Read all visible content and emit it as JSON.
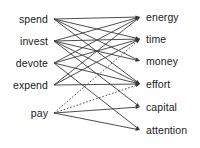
{
  "figure": {
    "type": "bipartite-collocation-network",
    "background_color": "#ffffff",
    "edge_color": "#3a3a3a",
    "text_color": "#1a1a1a",
    "width": 200,
    "height": 148
  },
  "left_column": {
    "name": "verbs",
    "items": [
      {
        "id": "spend",
        "label": "spend",
        "x": 48,
        "y": 19
      },
      {
        "id": "invest",
        "label": "invest",
        "x": 48,
        "y": 41
      },
      {
        "id": "devote",
        "label": "devote",
        "x": 48,
        "y": 63
      },
      {
        "id": "expend",
        "label": "expend",
        "x": 48,
        "y": 85
      },
      {
        "id": "pay",
        "label": "pay",
        "x": 48,
        "y": 113
      }
    ]
  },
  "right_column": {
    "name": "nouns",
    "items": [
      {
        "id": "energy",
        "label": "energy",
        "x": 146,
        "y": 17
      },
      {
        "id": "time",
        "label": "time",
        "x": 146,
        "y": 39
      },
      {
        "id": "money",
        "label": "money",
        "x": 146,
        "y": 61
      },
      {
        "id": "effort",
        "label": "effort",
        "x": 146,
        "y": 84
      },
      {
        "id": "capital",
        "label": "capital",
        "x": 146,
        "y": 107
      },
      {
        "id": "attention",
        "label": "attention",
        "x": 146,
        "y": 130
      }
    ]
  },
  "edges": [
    {
      "from": "spend",
      "to": "energy",
      "style": "solid"
    },
    {
      "from": "spend",
      "to": "time",
      "style": "solid"
    },
    {
      "from": "spend",
      "to": "money",
      "style": "solid"
    },
    {
      "from": "spend",
      "to": "effort",
      "style": "solid"
    },
    {
      "from": "invest",
      "to": "energy",
      "style": "solid"
    },
    {
      "from": "invest",
      "to": "time",
      "style": "solid"
    },
    {
      "from": "invest",
      "to": "money",
      "style": "solid"
    },
    {
      "from": "invest",
      "to": "effort",
      "style": "solid"
    },
    {
      "from": "invest",
      "to": "capital",
      "style": "solid"
    },
    {
      "from": "devote",
      "to": "energy",
      "style": "solid"
    },
    {
      "from": "devote",
      "to": "time",
      "style": "solid"
    },
    {
      "from": "devote",
      "to": "effort",
      "style": "solid"
    },
    {
      "from": "devote",
      "to": "attention",
      "style": "solid"
    },
    {
      "from": "expend",
      "to": "energy",
      "style": "solid"
    },
    {
      "from": "expend",
      "to": "time",
      "style": "solid"
    },
    {
      "from": "expend",
      "to": "effort",
      "style": "solid"
    },
    {
      "from": "pay",
      "to": "time",
      "style": "dotted"
    },
    {
      "from": "pay",
      "to": "effort",
      "style": "dotted"
    },
    {
      "from": "pay",
      "to": "capital",
      "style": "solid"
    },
    {
      "from": "pay",
      "to": "attention",
      "style": "solid"
    }
  ],
  "edge_geometry": {
    "left_anchor_offset_x": 6,
    "right_anchor_offset_x": -6,
    "stroke_width": 0.9,
    "dash_pattern": "1.6 1.8",
    "arrow_length": 4.5,
    "arrow_half_width": 1.7
  }
}
